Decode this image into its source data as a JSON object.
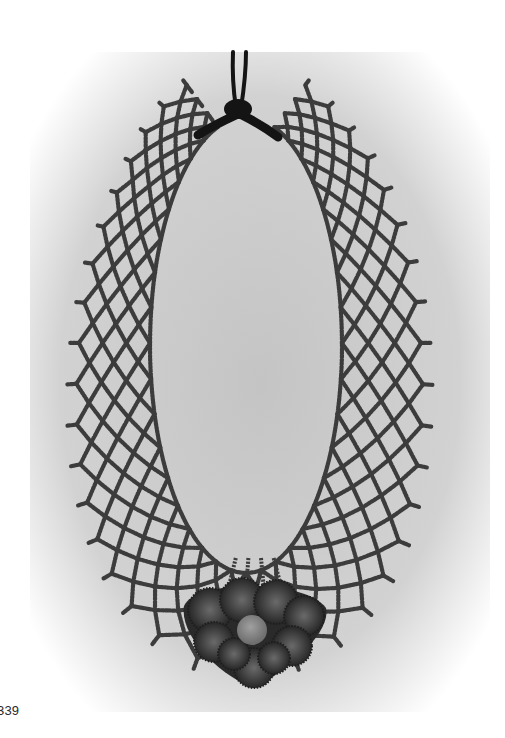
{
  "figure": {
    "number_label": "339",
    "style": "grayscale photograph"
  },
  "colors": {
    "page": "#ffffff",
    "backdrop_center": "#c9c9c9",
    "backdrop_edge": "#f4f4f4",
    "bead": "#3c3c3c",
    "cord": "#141414",
    "pendant_dark": "#2a2a2a",
    "pendant_mid": "#5e5e5e",
    "pendant_center": "#8a8a8a"
  },
  "geometry": {
    "neck_center": [
      246,
      345
    ],
    "neck_rx": 96,
    "neck_ry": 228,
    "net_width": 95,
    "rows": 6,
    "cols": 36,
    "cord_top": [
      240,
      52
    ],
    "knot": [
      238,
      112
    ],
    "pendant_center": [
      254,
      628
    ]
  }
}
